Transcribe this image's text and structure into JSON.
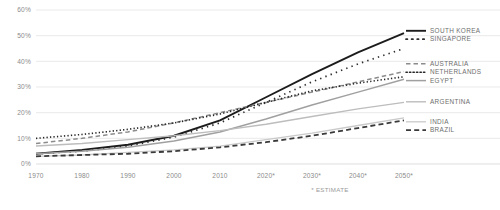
{
  "chart_data": {
    "type": "line",
    "title": "",
    "subtitle": "",
    "xlabel": "",
    "ylabel": "",
    "x": [
      1970,
      1980,
      1990,
      2000,
      2010,
      2020,
      2030,
      2040,
      2050
    ],
    "x_tick_labels": [
      "1970",
      "1980",
      "1990",
      "2000",
      "2010",
      "2020*",
      "2030*",
      "2040*",
      "2050*"
    ],
    "y_tick_labels": [
      "0%",
      "10%",
      "20%",
      "30%",
      "40%",
      "50%",
      "60%"
    ],
    "y_tick_values": [
      0,
      10,
      20,
      30,
      40,
      50,
      60
    ],
    "xlim": [
      1970,
      2050
    ],
    "ylim": [
      0,
      60
    ],
    "grid": true,
    "legend_position": "right",
    "footnote": "* ESTIMATE",
    "series": [
      {
        "name": "SOUTH KOREA",
        "style": "solid",
        "color": "#1c1c1c",
        "width": 1.9,
        "values": [
          4.0,
          5.5,
          7.5,
          11.0,
          17.0,
          26.0,
          35.0,
          43.5,
          51.0
        ]
      },
      {
        "name": "SINGAPORE",
        "style": "dotted-sparse",
        "color": "#2e2e2e",
        "width": 1.7,
        "values": [
          4.0,
          5.0,
          7.0,
          10.5,
          16.0,
          24.0,
          32.0,
          39.0,
          45.0
        ]
      },
      {
        "name": "AUSTRALIA",
        "style": "dashed",
        "color": "#8c8c8c",
        "width": 1.5,
        "values": [
          8.0,
          10.0,
          12.5,
          16.0,
          20.0,
          24.0,
          28.0,
          32.0,
          36.0
        ]
      },
      {
        "name": "NETHERLANDS",
        "style": "dotted-dense",
        "color": "#262626",
        "width": 1.6,
        "values": [
          10.0,
          11.5,
          13.5,
          16.0,
          19.5,
          24.0,
          28.5,
          31.5,
          34.0
        ]
      },
      {
        "name": "EGYPT",
        "style": "solid",
        "color": "#a0a0a0",
        "width": 1.5,
        "values": [
          4.0,
          5.0,
          6.5,
          9.0,
          12.5,
          17.5,
          23.0,
          28.0,
          33.0
        ]
      },
      {
        "name": "ARGENTINA",
        "style": "solid",
        "color": "#bdbdbd",
        "width": 1.4,
        "values": [
          7.0,
          8.0,
          9.5,
          11.0,
          13.0,
          15.5,
          18.5,
          21.5,
          24.0
        ]
      },
      {
        "name": "INDIA",
        "style": "solid",
        "color": "#cacaca",
        "width": 1.3,
        "values": [
          3.0,
          3.5,
          4.5,
          5.5,
          7.0,
          9.5,
          12.0,
          15.0,
          18.0
        ]
      },
      {
        "name": "BRAZIL",
        "style": "dashed-bold",
        "color": "#3a3a3a",
        "width": 1.8,
        "values": [
          3.0,
          3.5,
          4.0,
          5.0,
          6.5,
          8.5,
          11.0,
          14.0,
          17.0
        ]
      }
    ]
  },
  "legend": {
    "groups": [
      {
        "labels": [
          "SOUTH KOREA",
          "SINGAPORE"
        ]
      },
      {
        "labels": [
          "AUSTRALIA",
          "NETHERLANDS",
          "EGYPT"
        ]
      },
      {
        "labels": [
          "ARGENTINA"
        ]
      },
      {
        "labels": [
          "INDIA",
          "BRAZIL"
        ]
      }
    ]
  }
}
